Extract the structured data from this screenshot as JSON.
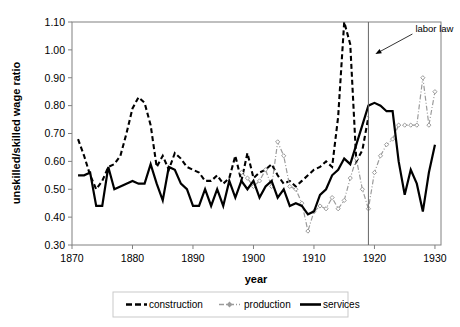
{
  "chart_data": {
    "type": "line",
    "title": "",
    "xlabel": "year",
    "ylabel": "unskilled/skilled wage ratio",
    "xlim": [
      1870,
      1931
    ],
    "ylim": [
      0.3,
      1.1
    ],
    "xticks": [
      1870,
      1880,
      1890,
      1900,
      1910,
      1920,
      1930
    ],
    "yticks": [
      "0.30",
      "0.40",
      "0.50",
      "0.60",
      "0.70",
      "0.80",
      "0.90",
      "1.00",
      "1.10"
    ],
    "grid": false,
    "legend_position": "bottom",
    "annotations": [
      {
        "text": "labor law",
        "year": 1919,
        "kind": "vertical-line-with-arrow-label"
      }
    ],
    "series": [
      {
        "name": "construction",
        "style": "dashed",
        "color": "#000000",
        "x": [
          1871,
          1872,
          1873,
          1874,
          1875,
          1876,
          1877,
          1878,
          1879,
          1880,
          1881,
          1882,
          1883,
          1884,
          1885,
          1886,
          1887,
          1888,
          1889,
          1890,
          1891,
          1892,
          1893,
          1894,
          1895,
          1896,
          1897,
          1898,
          1899,
          1900,
          1901,
          1902,
          1903,
          1904,
          1905,
          1906,
          1907,
          1908,
          1909,
          1910,
          1911,
          1912,
          1913,
          1914,
          1915,
          1916,
          1917,
          1918,
          1919
        ],
        "values": [
          0.68,
          0.62,
          0.55,
          0.5,
          0.53,
          0.58,
          0.59,
          0.62,
          0.7,
          0.79,
          0.83,
          0.81,
          0.73,
          0.58,
          0.62,
          0.57,
          0.63,
          0.61,
          0.58,
          0.57,
          0.56,
          0.53,
          0.53,
          0.55,
          0.52,
          0.54,
          0.62,
          0.53,
          0.63,
          0.54,
          0.56,
          0.57,
          0.59,
          0.55,
          0.52,
          0.53,
          0.51,
          0.53,
          0.55,
          0.57,
          0.58,
          0.6,
          0.58,
          0.76,
          1.1,
          1.02,
          0.6,
          0.64,
          0.76
        ]
      },
      {
        "name": "production",
        "style": "dash-dot-marker",
        "color": "#9b9b9b",
        "x": [
          1898,
          1899,
          1900,
          1901,
          1902,
          1903,
          1904,
          1905,
          1906,
          1907,
          1908,
          1909,
          1910,
          1911,
          1912,
          1913,
          1914,
          1915,
          1916,
          1917,
          1918,
          1919,
          1920,
          1921,
          1922,
          1923,
          1924,
          1925,
          1926,
          1927,
          1928,
          1929,
          1930
        ],
        "values": [
          0.56,
          0.54,
          0.51,
          0.53,
          0.57,
          0.51,
          0.67,
          0.62,
          0.51,
          0.5,
          0.45,
          0.35,
          0.42,
          0.44,
          0.43,
          0.47,
          0.43,
          0.46,
          0.54,
          0.61,
          0.5,
          0.43,
          0.56,
          0.62,
          0.66,
          0.68,
          0.73,
          0.73,
          0.73,
          0.73,
          0.9,
          0.73,
          0.85
        ]
      },
      {
        "name": "services",
        "style": "solid",
        "color": "#000000",
        "x": [
          1871,
          1872,
          1873,
          1874,
          1875,
          1876,
          1877,
          1878,
          1879,
          1880,
          1881,
          1882,
          1883,
          1884,
          1885,
          1886,
          1887,
          1888,
          1889,
          1890,
          1891,
          1892,
          1893,
          1894,
          1895,
          1896,
          1897,
          1898,
          1899,
          1900,
          1901,
          1902,
          1903,
          1904,
          1905,
          1906,
          1907,
          1908,
          1909,
          1910,
          1911,
          1912,
          1913,
          1914,
          1915,
          1916,
          1917,
          1918,
          1919,
          1920,
          1921,
          1922,
          1923,
          1924,
          1925,
          1926,
          1927,
          1928,
          1929,
          1930
        ],
        "values": [
          0.55,
          0.55,
          0.56,
          0.44,
          0.44,
          0.58,
          0.5,
          0.51,
          0.52,
          0.53,
          0.52,
          0.52,
          0.59,
          0.52,
          0.46,
          0.58,
          0.57,
          0.52,
          0.5,
          0.44,
          0.44,
          0.5,
          0.44,
          0.5,
          0.44,
          0.53,
          0.47,
          0.53,
          0.5,
          0.53,
          0.47,
          0.51,
          0.53,
          0.47,
          0.5,
          0.44,
          0.45,
          0.44,
          0.41,
          0.42,
          0.48,
          0.5,
          0.55,
          0.57,
          0.61,
          0.59,
          0.66,
          0.73,
          0.8,
          0.81,
          0.8,
          0.78,
          0.78,
          0.6,
          0.48,
          0.57,
          0.52,
          0.42,
          0.56,
          0.66
        ]
      }
    ]
  },
  "legend": {
    "items": [
      {
        "label": "construction",
        "marker": "dashed-line"
      },
      {
        "label": "production",
        "marker": "dash-dot-line-with-diamond"
      },
      {
        "label": "services",
        "marker": "solid-line"
      }
    ]
  },
  "axes": {
    "x_title": "year",
    "y_title": "unskilled/skilled wage ratio"
  }
}
